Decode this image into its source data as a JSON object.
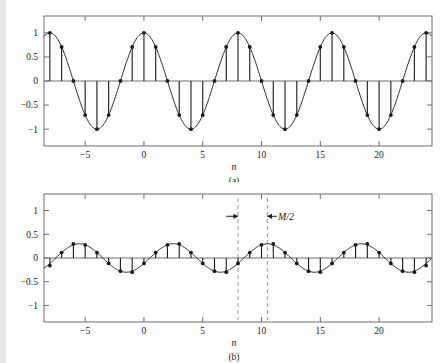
{
  "figure": {
    "background_color": "#fefefe",
    "line_color": "#1a1a1a",
    "axis_color": "#6f6f6f",
    "dashed_color": "#9a9a9a",
    "panels": [
      {
        "id": "panel-a",
        "caption": "(a)",
        "xlabel": "n",
        "ylabel": "",
        "annotation": ""
      },
      {
        "id": "panel-b",
        "caption": "(b)",
        "xlabel": "n",
        "ylabel": "",
        "annotation": "M/2"
      }
    ]
  },
  "chart_data": [
    {
      "type": "line",
      "id": "panel-a",
      "title": "",
      "subtitle": "",
      "caption": "(a)",
      "xlabel": "n",
      "ylabel": "",
      "xlim": [
        -8.5,
        24.5
      ],
      "ylim": [
        -1.35,
        1.35
      ],
      "xticks": [
        -5,
        0,
        5,
        10,
        15,
        20
      ],
      "xticklabels": [
        "−5",
        "0",
        "5",
        "10",
        "15",
        "20"
      ],
      "yticks": [
        -1,
        -0.5,
        0,
        0.5,
        1
      ],
      "yticklabels": [
        "−1",
        "−0.5",
        "0",
        "0.5",
        "1"
      ],
      "grid": false,
      "legend": null,
      "series": [
        {
          "name": "cos(pi n / 4) continuous envelope",
          "kind": "line",
          "formula": "cos(pi*n/4)",
          "amplitude": 1.0,
          "period": 8
        },
        {
          "name": "cos(pi n / 4) samples (stems)",
          "kind": "stem",
          "x": [
            -8,
            -7,
            -6,
            -5,
            -4,
            -3,
            -2,
            -1,
            0,
            1,
            2,
            3,
            4,
            5,
            6,
            7,
            8,
            9,
            10,
            11,
            12,
            13,
            14,
            15,
            16,
            17,
            18,
            19,
            20,
            21,
            22,
            23,
            24
          ],
          "y": [
            1,
            0.707,
            0,
            -0.707,
            -1,
            -0.707,
            0,
            0.707,
            1,
            0.707,
            0,
            -0.707,
            -1,
            -0.707,
            0,
            0.707,
            1,
            0.707,
            0,
            -0.707,
            -1,
            -0.707,
            0,
            0.707,
            1,
            0.707,
            0,
            -0.707,
            -1,
            -0.707,
            0,
            0.707,
            1
          ]
        }
      ]
    },
    {
      "type": "line",
      "id": "panel-b",
      "title": "",
      "subtitle": "",
      "caption": "(b)",
      "xlabel": "n",
      "ylabel": "",
      "xlim": [
        -8.5,
        24.5
      ],
      "ylim": [
        -1.35,
        1.35
      ],
      "xticks": [
        -5,
        0,
        5,
        10,
        15,
        20
      ],
      "xticklabels": [
        "−5",
        "0",
        "5",
        "10",
        "15",
        "20"
      ],
      "yticks": [
        -1,
        -0.5,
        0,
        0.5,
        1
      ],
      "yticklabels": [
        "−1",
        "−0.5",
        "0",
        "0.5",
        "1"
      ],
      "grid": false,
      "legend": null,
      "annotations": [
        {
          "text": "M/2",
          "x": 11.4,
          "y": 0.88
        },
        {
          "kind": "vline",
          "x": 8.0,
          "style": "dashed"
        },
        {
          "kind": "vline",
          "x": 10.5,
          "style": "dashed"
        },
        {
          "kind": "arrow",
          "from_x": 7.0,
          "to_x": 8.0,
          "y": 0.88
        },
        {
          "kind": "arrow",
          "from_x": 11.3,
          "to_x": 10.5,
          "y": 0.88
        }
      ],
      "series": [
        {
          "name": "0.3 cos(pi (n-2.5)/4) continuous envelope",
          "kind": "line",
          "formula": "0.3*cos(pi*(n-10.5)/4)",
          "amplitude": 0.3,
          "period": 8,
          "shift": 2.5
        },
        {
          "name": "0.3 cos(pi (n-2.5)/4) samples (stems)",
          "kind": "stem",
          "x": [
            -8,
            -7,
            -6,
            -5,
            -4,
            -3,
            -2,
            -1,
            0,
            1,
            2,
            3,
            4,
            5,
            6,
            7,
            8,
            9,
            10,
            11,
            12,
            13,
            14,
            15,
            16,
            17,
            18,
            19,
            20,
            21,
            22,
            23,
            24
          ],
          "y": [
            -0.16,
            0.115,
            0.3,
            0.277,
            0.115,
            -0.115,
            -0.277,
            -0.3,
            -0.115,
            0.115,
            0.277,
            0.3,
            0.115,
            -0.115,
            -0.277,
            -0.3,
            -0.115,
            0.115,
            0.277,
            0.3,
            0.115,
            -0.115,
            -0.277,
            -0.3,
            -0.115,
            0.115,
            0.277,
            0.3,
            0.115,
            -0.115,
            -0.277,
            -0.3,
            -0.16
          ]
        }
      ]
    }
  ]
}
